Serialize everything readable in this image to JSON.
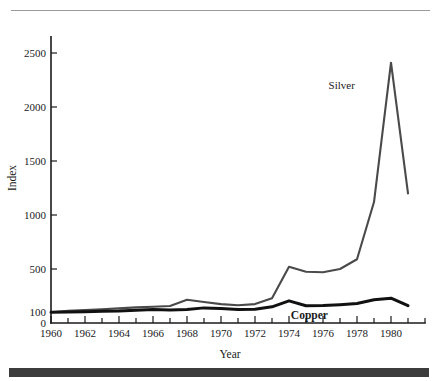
{
  "figure": {
    "background_color": "#ffffff",
    "top_rule_color": "#9a9a9a",
    "bottom_bar_color": "#3c3c3c"
  },
  "chart_data": {
    "type": "line",
    "title": "",
    "xlabel": "Year",
    "ylabel": "Index",
    "xlim": [
      1960,
      1982
    ],
    "ylim": [
      0,
      2650
    ],
    "grid": false,
    "legend_position": "inline-annotation",
    "x_tick_labels": [
      "1960",
      "1962",
      "1964",
      "1966",
      "1968",
      "1970",
      "1972",
      "1974",
      "1976",
      "1978",
      "1980"
    ],
    "x_tick_values": [
      1960,
      1962,
      1964,
      1966,
      1968,
      1970,
      1972,
      1974,
      1976,
      1978,
      1980
    ],
    "x_minor_tick_step": 1,
    "y_tick_labels": [
      "0",
      "100",
      "500",
      "1000",
      "1500",
      "2000",
      "2500"
    ],
    "y_tick_values": [
      0,
      100,
      500,
      1000,
      1500,
      2000,
      2500
    ],
    "x": [
      1960,
      1961,
      1962,
      1963,
      1964,
      1965,
      1966,
      1967,
      1968,
      1969,
      1970,
      1971,
      1972,
      1973,
      1974,
      1975,
      1976,
      1977,
      1978,
      1979,
      1980,
      1981
    ],
    "series": [
      {
        "name": "Silver",
        "color": "#4a4a4a",
        "stroke_width": 2.1,
        "label": "Silver",
        "label_bold": false,
        "label_x": 1977.1,
        "label_y": 2170,
        "values": [
          100,
          112,
          120,
          128,
          135,
          145,
          150,
          158,
          215,
          195,
          175,
          165,
          175,
          230,
          520,
          475,
          470,
          500,
          590,
          1120,
          2410,
          1200
        ]
      },
      {
        "name": "Copper",
        "color": "#111111",
        "stroke_width": 3.0,
        "label": "Copper",
        "label_bold": true,
        "label_x": 1975.2,
        "label_y": 35,
        "values": [
          100,
          102,
          104,
          108,
          110,
          118,
          124,
          120,
          126,
          140,
          135,
          124,
          128,
          150,
          205,
          160,
          162,
          170,
          180,
          215,
          230,
          160
        ]
      }
    ]
  }
}
